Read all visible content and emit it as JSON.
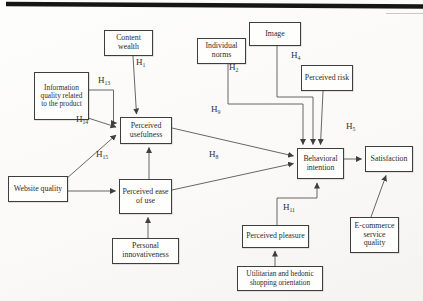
{
  "diagram": {
    "type": "path-model",
    "nodes": [
      {
        "id": "website-quality",
        "label": "Website quality"
      },
      {
        "id": "information-quality",
        "label": "Information quality related to the product"
      },
      {
        "id": "content-wealth",
        "label": "Content wealth"
      },
      {
        "id": "individual-norms",
        "label": "Individual norms"
      },
      {
        "id": "image",
        "label": "Image"
      },
      {
        "id": "perceived-risk",
        "label": "Perceived risk"
      },
      {
        "id": "perceived-usefulness",
        "label": "Perceived usefulness"
      },
      {
        "id": "perceived-ease-of-use",
        "label": "Perceived ease of use"
      },
      {
        "id": "personal-innovativeness",
        "label": "Personal innovativeness"
      },
      {
        "id": "behavioral-intention",
        "label": "Behavioral intention"
      },
      {
        "id": "satisfaction",
        "label": "Satisfaction"
      },
      {
        "id": "ecommerce-service-quality",
        "label": "E-commerce service quality"
      },
      {
        "id": "perceived-pleasure",
        "label": "Perceived pleasure"
      },
      {
        "id": "utilitarian-hedonic",
        "label": "Utilitarian and hedonic shopping orientation"
      }
    ],
    "hypotheses": [
      {
        "base": "H",
        "sub": "1"
      },
      {
        "base": "H",
        "sub": "2"
      },
      {
        "base": "H",
        "sub": "4"
      },
      {
        "base": "H",
        "sub": "5"
      },
      {
        "base": "H",
        "sub": "8"
      },
      {
        "base": "H",
        "sub": "9"
      },
      {
        "base": "H",
        "sub": "11"
      },
      {
        "base": "H",
        "sub": "13"
      },
      {
        "base": "H",
        "sub": "14"
      },
      {
        "base": "H",
        "sub": "15"
      }
    ],
    "edges": [
      {
        "labels": [
          "H1"
        ],
        "from": "Content wealth",
        "to": "Perceived usefulness"
      },
      {
        "labels": [
          "H13"
        ],
        "from": "Information quality related to the product",
        "to": "Perceived usefulness"
      },
      {
        "labels": [
          "H14"
        ],
        "from": "Information quality related to the product",
        "to": "Perceived usefulness"
      },
      {
        "labels": [
          "H15"
        ],
        "from": "Website quality",
        "to": "Perceived usefulness"
      },
      {
        "labels": [],
        "from": "Website quality",
        "to": "Perceived ease of use"
      },
      {
        "labels": [],
        "from": "Personal innovativeness",
        "to": "Perceived ease of use"
      },
      {
        "labels": [],
        "from": "Perceived ease of use",
        "to": "Perceived usefulness"
      },
      {
        "labels": [],
        "from": "Perceived usefulness",
        "to": "Behavioral intention"
      },
      {
        "labels": [
          "H8"
        ],
        "from": "Perceived ease of use",
        "to": "Behavioral intention"
      },
      {
        "labels": [
          "H2",
          "H9"
        ],
        "from": "Individual norms",
        "to": "Behavioral intention"
      },
      {
        "labels": [
          "H4"
        ],
        "from": "Image",
        "to": "Behavioral intention"
      },
      {
        "labels": [],
        "from": "Perceived risk",
        "to": "Behavioral intention"
      },
      {
        "labels": [
          "H5"
        ],
        "from": "Behavioral intention",
        "to": "Satisfaction"
      },
      {
        "labels": [
          "H11"
        ],
        "from": "Perceived pleasure",
        "to": "Behavioral intention"
      },
      {
        "labels": [],
        "from": "Utilitarian and hedonic shopping orientation",
        "to": "Perceived pleasure"
      },
      {
        "labels": [],
        "from": "E-commerce service quality",
        "to": "Satisfaction"
      }
    ]
  }
}
